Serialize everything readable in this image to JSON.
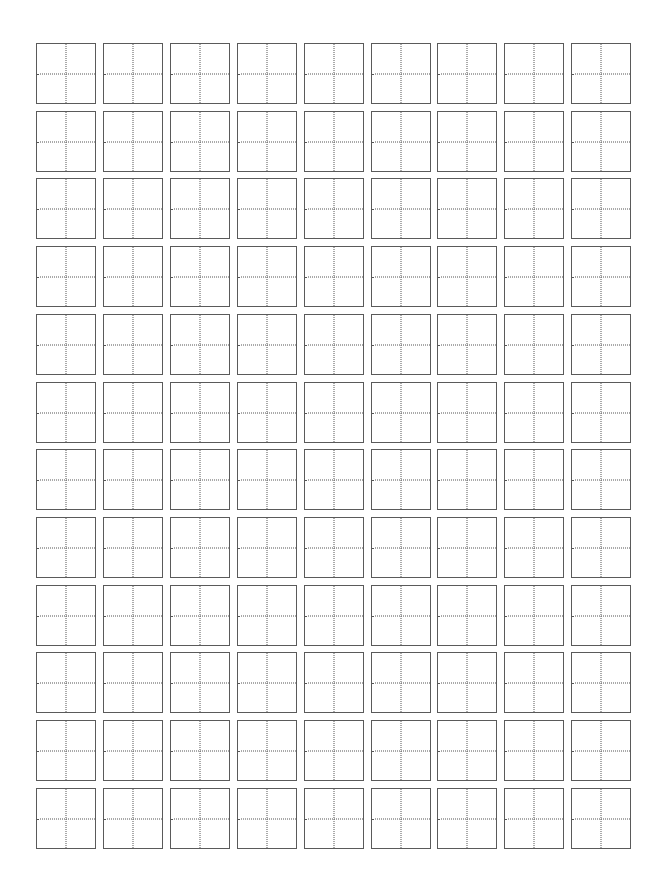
{
  "worksheet": {
    "type": "tianzige-practice-grid",
    "rows": 12,
    "columns": 9,
    "cell_width": 60,
    "cell_height": 61,
    "pitch_x": 66.9,
    "pitch_y": 67.7,
    "border_color": "#5a5a5a",
    "guide_color": "#555555",
    "guide_style": "dotted"
  }
}
